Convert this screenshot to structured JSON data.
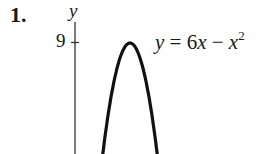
{
  "problem": {
    "number": "1."
  },
  "equation": {
    "lhs": "y",
    "eq": " = 6",
    "var": "x",
    "minus": " − ",
    "var2": "x",
    "exp": "2",
    "full": "y = 6x − x^2"
  },
  "colors": {
    "curve": "#111111",
    "axis": "#333333",
    "background": "#ffffff"
  },
  "chart_data": {
    "type": "line",
    "title": "",
    "annotation": "y = 6x − x^2",
    "xlabel": "",
    "ylabel": "y",
    "y_ticks": [
      9
    ],
    "y_tick_labels": [
      "9"
    ],
    "x": [
      0.6,
      1,
      1.5,
      2,
      2.5,
      3,
      3.5,
      4,
      4.5,
      5,
      5.4
    ],
    "series": [
      {
        "name": "y = 6x − x^2",
        "values": [
          3.24,
          5,
          6.75,
          8,
          8.75,
          9,
          8.75,
          8,
          6.75,
          5,
          3.24
        ]
      }
    ],
    "vertex": {
      "x": 3,
      "y": 9
    },
    "grid": false,
    "legend": "none",
    "ylim": [
      3.2,
      9.8
    ]
  }
}
